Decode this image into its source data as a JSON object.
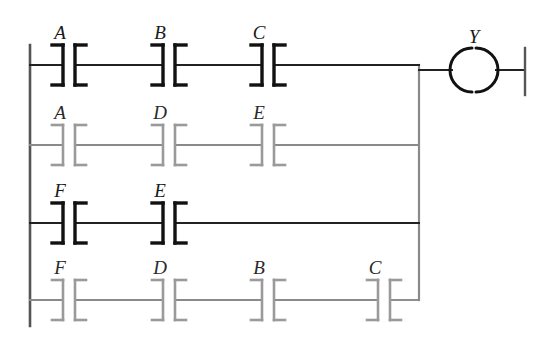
{
  "diagram": {
    "type": "ladder-logic",
    "title": "",
    "colors": {
      "rail": "#555555",
      "wire_dark": "#222222",
      "wire_light": "#8a8a8a",
      "contact_dark": "#111111",
      "contact_light": "#9a9a9a",
      "coil": "#111111",
      "background": "#ffffff"
    },
    "left_rail": {
      "x": 30,
      "y_top": 45,
      "y_bottom": 326
    },
    "right_rail": {
      "x": 525,
      "y_top": 48,
      "y_bottom": 95
    },
    "branch_rail": {
      "x": 419,
      "y_top": 65,
      "y_bottom": 300
    },
    "rungs": [
      {
        "name": "rung-1",
        "y": 65,
        "shade": "dark",
        "contacts": [
          {
            "label": "A",
            "x": 69,
            "type": "normally-open"
          },
          {
            "label": "B",
            "x": 169,
            "type": "normally-open"
          },
          {
            "label": "C",
            "x": 268,
            "type": "normally-open"
          }
        ],
        "wire_end_x": 419
      },
      {
        "name": "rung-2",
        "y": 145,
        "shade": "light",
        "contacts": [
          {
            "label": "A",
            "x": 69,
            "type": "normally-open"
          },
          {
            "label": "D",
            "x": 169,
            "type": "normally-open"
          },
          {
            "label": "E",
            "x": 268,
            "type": "normally-open"
          }
        ],
        "wire_end_x": 419
      },
      {
        "name": "rung-3",
        "y": 223,
        "shade": "dark",
        "contacts": [
          {
            "label": "F",
            "x": 69,
            "type": "normally-open"
          },
          {
            "label": "E",
            "x": 169,
            "type": "normally-open"
          }
        ],
        "wire_end_x": 419
      },
      {
        "name": "rung-4",
        "y": 300,
        "shade": "light",
        "contacts": [
          {
            "label": "F",
            "x": 69,
            "type": "normally-open"
          },
          {
            "label": "D",
            "x": 169,
            "type": "normally-open"
          },
          {
            "label": "B",
            "x": 268,
            "type": "normally-open"
          },
          {
            "label": "C",
            "x": 384,
            "type": "normally-open"
          }
        ],
        "wire_end_x": 419
      }
    ],
    "coil": {
      "label": "Y",
      "cx": 474,
      "cy": 70,
      "r": 22,
      "type": "output-coil",
      "lead_left_x": 419,
      "lead_right_x": 525
    },
    "expression": "Y = (A·B·C) + (A·D·E) + (F·E) + (F·D·B·C)",
    "logic_signals": [
      "A",
      "B",
      "C",
      "D",
      "E",
      "F",
      "Y"
    ]
  }
}
